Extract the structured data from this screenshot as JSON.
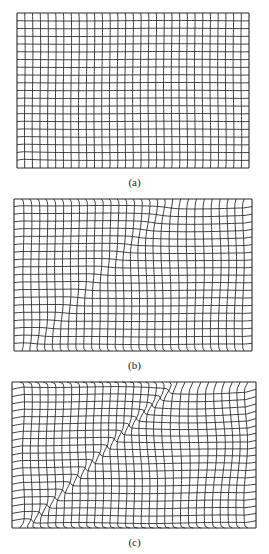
{
  "figure": {
    "line_color": "#2a2a2a",
    "background": "#ffffff",
    "panels": [
      {
        "id": "a",
        "label": "(a)",
        "box": {
          "x": 17,
          "y": 13,
          "w": 232,
          "h": 155
        },
        "label_y": 176,
        "cols": 30,
        "rows": 20,
        "deformation": {
          "type": "corner",
          "strength": 0.35
        }
      },
      {
        "id": "b",
        "label": "(b)",
        "box": {
          "x": 14,
          "y": 199,
          "w": 238,
          "h": 152
        },
        "label_y": 359,
        "cols": 30,
        "rows": 20,
        "deformation": {
          "type": "band",
          "strength": 0.55
        }
      },
      {
        "id": "c",
        "label": "(c)",
        "box": {
          "x": 12,
          "y": 382,
          "w": 244,
          "h": 146
        },
        "label_y": 536,
        "cols": 31,
        "rows": 20,
        "deformation": {
          "type": "shear",
          "strength": 1.0
        }
      }
    ]
  }
}
